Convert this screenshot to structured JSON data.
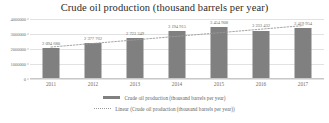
{
  "chart_data": {
    "type": "bar",
    "title": "Crude oil production (thousand barrels per year)",
    "xlabel": "",
    "ylabel": "",
    "categories": [
      "2011",
      "2012",
      "2013",
      "2014",
      "2015",
      "2016",
      "2017"
    ],
    "values": [
      2094680,
      2377762,
      2723349,
      3194915,
      3454908,
      3233432,
      3419954
    ],
    "value_labels": [
      "2 094 680",
      "2 377 762",
      "2 723 349",
      "3 194 915",
      "3 454 908",
      "3 233 432",
      "3 419 954"
    ],
    "ylim": [
      0,
      4000000
    ],
    "ytick_labels": [
      "4000000",
      "3000000",
      "2000000",
      "1000000",
      "0"
    ],
    "ytick_values": [
      4000000,
      3000000,
      2000000,
      1000000,
      0
    ],
    "grid": true,
    "legend_position": "bottom",
    "series": [
      {
        "name": "Crude oil production (thousand barrels per year)",
        "type": "bar",
        "color": "#808080",
        "values": [
          2094680,
          2377762,
          2723349,
          3194915,
          3454908,
          3233432,
          3419954
        ]
      },
      {
        "name": "Linear (Crude oil production (thousand barrels per year))",
        "type": "line",
        "style": "dotted",
        "color": "#9a9a9a",
        "values": [
          2131000,
          2369000,
          2607000,
          2845000,
          3083000,
          3321000,
          3559000
        ]
      }
    ]
  },
  "legend": {
    "items": [
      {
        "label": "Crude oil production (thousand barrels per year)",
        "swatch": "solid-bar-swatch"
      },
      {
        "label": "Linear (Crude oil production (thousand barrels per year))",
        "swatch": "dotted-line-swatch"
      }
    ]
  },
  "colors": {
    "bar": "#808080",
    "trendline": "#9a9a9a",
    "gridline": "#e2e2e2",
    "axis": "#c8c8c8",
    "title_text": "#2b2b2b",
    "tick_text": "#6e6e6e",
    "background": "#ffffff"
  }
}
